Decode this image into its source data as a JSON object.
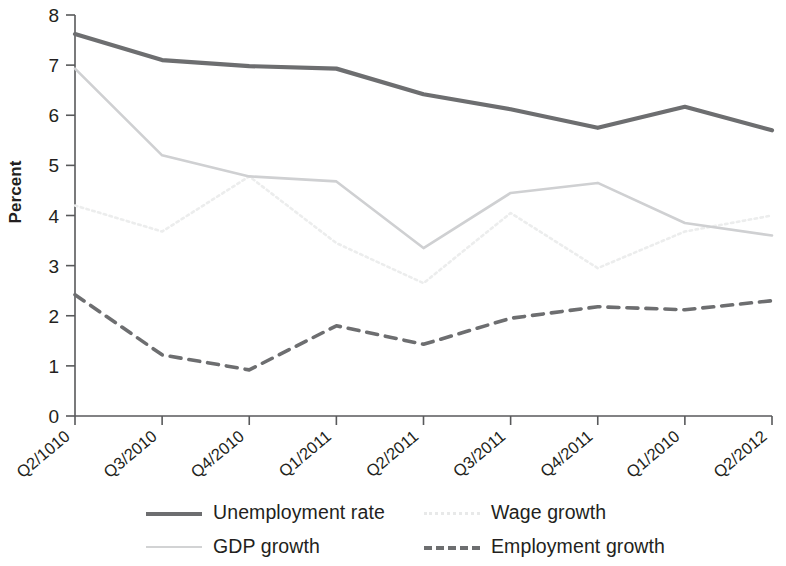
{
  "chart_data": {
    "type": "line",
    "title": "",
    "xlabel": "",
    "ylabel": "Percent",
    "ylim": [
      0,
      8
    ],
    "ytick_values": [
      0,
      1,
      2,
      3,
      4,
      5,
      6,
      7,
      8
    ],
    "ytick_labels": [
      "0",
      "1",
      "2",
      "3",
      "4",
      "5",
      "6",
      "7",
      "8"
    ],
    "grid": false,
    "legend_position": "bottom",
    "categories": [
      "Q2/1010",
      "Q3/2010",
      "Q4/2010",
      "Q1/2011",
      "Q2/2011",
      "Q3/2011",
      "Q4/2011",
      "Q1/2010",
      "Q2/2012"
    ],
    "series": [
      {
        "name": "Unemployment rate",
        "style": "solid",
        "color": "#6d6e70",
        "width": 4.2,
        "values": [
          7.62,
          7.1,
          6.98,
          6.93,
          6.42,
          6.12,
          5.75,
          6.17,
          5.7
        ]
      },
      {
        "name": "GDP growth",
        "style": "solid",
        "color": "#cfd0d2",
        "width": 2.6,
        "values": [
          6.93,
          5.2,
          4.78,
          4.68,
          3.35,
          4.45,
          4.65,
          3.85,
          3.6
        ]
      },
      {
        "name": "Wage growth",
        "style": "dotted",
        "color": "#eceded",
        "width": 2.6,
        "values": [
          4.2,
          3.68,
          4.78,
          3.45,
          2.65,
          4.05,
          2.95,
          3.68,
          4.0
        ]
      },
      {
        "name": "Employment growth",
        "style": "dashed",
        "color": "#6d6e70",
        "width": 3.6,
        "values": [
          2.42,
          1.22,
          0.92,
          1.8,
          1.43,
          1.95,
          2.18,
          2.12,
          2.3
        ]
      }
    ]
  },
  "legend": {
    "items": [
      {
        "label": "Unemployment rate",
        "swatch": "solid-dark-line-icon"
      },
      {
        "label": "Wage growth",
        "swatch": "dotted-light-line-icon"
      },
      {
        "label": "GDP growth",
        "swatch": "solid-light-line-icon"
      },
      {
        "label": "Employment growth",
        "swatch": "dashed-dark-line-icon"
      }
    ]
  }
}
